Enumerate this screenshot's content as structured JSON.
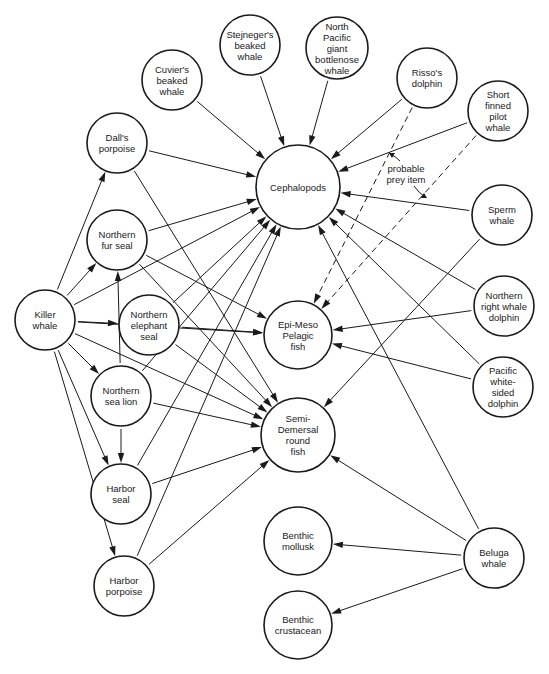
{
  "chart_data": {
    "type": "diagram",
    "title": "",
    "nodes": [
      {
        "id": "killer",
        "label": [
          "Killer",
          "whale"
        ]
      },
      {
        "id": "dalls",
        "label": [
          "Dall's",
          "porpoise"
        ]
      },
      {
        "id": "cuviers",
        "label": [
          "Cuvier's",
          "beaked",
          "whale"
        ]
      },
      {
        "id": "stejnegers",
        "label": [
          "Stejneger's",
          "beaked",
          "whale"
        ]
      },
      {
        "id": "npgbw",
        "label": [
          "North",
          "Pacific",
          "giant",
          "bottlenose",
          "whale"
        ]
      },
      {
        "id": "rissos",
        "label": [
          "Risso's",
          "dolphin"
        ]
      },
      {
        "id": "sfpw",
        "label": [
          "Short",
          "finned",
          "pilot",
          "whale"
        ]
      },
      {
        "id": "sperm",
        "label": [
          "Sperm",
          "whale"
        ]
      },
      {
        "id": "nrwd",
        "label": [
          "Northern",
          "right whale",
          "dolphin"
        ]
      },
      {
        "id": "pwsd",
        "label": [
          "Pacific",
          "white-",
          "sided",
          "dolphin"
        ]
      },
      {
        "id": "nfs",
        "label": [
          "Northern",
          "fur seal"
        ]
      },
      {
        "id": "nes",
        "label": [
          "Northern",
          "elephant",
          "seal"
        ]
      },
      {
        "id": "nsl",
        "label": [
          "Northern",
          "sea lion"
        ]
      },
      {
        "id": "hseal",
        "label": [
          "Harbor",
          "seal"
        ]
      },
      {
        "id": "hporp",
        "label": [
          "Harbor",
          "porpoise"
        ]
      },
      {
        "id": "beluga",
        "label": [
          "Beluga",
          "whale"
        ]
      },
      {
        "id": "ceph",
        "label": [
          "Cephalopods"
        ]
      },
      {
        "id": "epi",
        "label": [
          "Epi-Meso",
          "Pelagic",
          "fish"
        ]
      },
      {
        "id": "semi",
        "label": [
          "Semi-",
          "Demersal",
          "round",
          "fish"
        ]
      },
      {
        "id": "bmoll",
        "label": [
          "Benthic",
          "mollusk"
        ]
      },
      {
        "id": "bcrust",
        "label": [
          "Benthic",
          "crustacean"
        ]
      }
    ],
    "edges": [
      {
        "from": "killer",
        "to": "dalls",
        "style": "solid"
      },
      {
        "from": "killer",
        "to": "nfs",
        "style": "solid"
      },
      {
        "from": "killer",
        "to": "ceph",
        "style": "solid"
      },
      {
        "from": "killer",
        "to": "nes",
        "style": "solid"
      },
      {
        "from": "killer",
        "to": "nsl",
        "style": "solid"
      },
      {
        "from": "killer",
        "to": "epi",
        "style": "solid"
      },
      {
        "from": "killer",
        "to": "semi",
        "style": "solid"
      },
      {
        "from": "killer",
        "to": "hseal",
        "style": "solid"
      },
      {
        "from": "killer",
        "to": "hporp",
        "style": "solid"
      },
      {
        "from": "cuviers",
        "to": "ceph",
        "style": "solid"
      },
      {
        "from": "stejnegers",
        "to": "ceph",
        "style": "solid"
      },
      {
        "from": "npgbw",
        "to": "ceph",
        "style": "solid"
      },
      {
        "from": "rissos",
        "to": "ceph",
        "style": "solid"
      },
      {
        "from": "rissos",
        "to": "epi",
        "style": "dashed"
      },
      {
        "from": "sfpw",
        "to": "ceph",
        "style": "solid"
      },
      {
        "from": "sfpw",
        "to": "epi",
        "style": "dashed"
      },
      {
        "from": "sperm",
        "to": "ceph",
        "style": "solid"
      },
      {
        "from": "sperm",
        "to": "semi",
        "style": "solid"
      },
      {
        "from": "nrwd",
        "to": "ceph",
        "style": "solid"
      },
      {
        "from": "nrwd",
        "to": "epi",
        "style": "solid"
      },
      {
        "from": "pwsd",
        "to": "ceph",
        "style": "solid"
      },
      {
        "from": "pwsd",
        "to": "epi",
        "style": "solid"
      },
      {
        "from": "dalls",
        "to": "ceph",
        "style": "solid"
      },
      {
        "from": "dalls",
        "to": "semi",
        "style": "solid"
      },
      {
        "from": "nfs",
        "to": "ceph",
        "style": "solid"
      },
      {
        "from": "nfs",
        "to": "epi",
        "style": "solid"
      },
      {
        "from": "nfs",
        "to": "semi",
        "style": "solid"
      },
      {
        "from": "nes",
        "to": "ceph",
        "style": "solid"
      },
      {
        "from": "nes",
        "to": "epi",
        "style": "solid"
      },
      {
        "from": "nes",
        "to": "semi",
        "style": "solid"
      },
      {
        "from": "nsl",
        "to": "nfs",
        "style": "solid"
      },
      {
        "from": "nsl",
        "to": "hseal",
        "style": "solid"
      },
      {
        "from": "nsl",
        "to": "ceph",
        "style": "solid"
      },
      {
        "from": "nsl",
        "to": "semi",
        "style": "solid"
      },
      {
        "from": "hseal",
        "to": "ceph",
        "style": "solid"
      },
      {
        "from": "hseal",
        "to": "semi",
        "style": "solid"
      },
      {
        "from": "hporp",
        "to": "ceph",
        "style": "solid"
      },
      {
        "from": "hporp",
        "to": "semi",
        "style": "solid"
      },
      {
        "from": "beluga",
        "to": "ceph",
        "style": "solid"
      },
      {
        "from": "beluga",
        "to": "semi",
        "style": "solid"
      },
      {
        "from": "beluga",
        "to": "bmoll",
        "style": "solid"
      },
      {
        "from": "beluga",
        "to": "bcrust",
        "style": "solid"
      }
    ],
    "annotations": [
      {
        "text": [
          "probable",
          "prey item"
        ],
        "refers_to": "dashed edges"
      }
    ]
  }
}
